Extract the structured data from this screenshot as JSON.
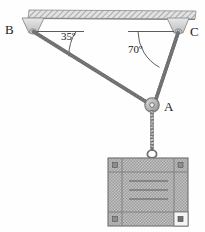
{
  "figure": {
    "type": "physics-free-body-diagram",
    "title": ""
  },
  "labels": {
    "point_b": "B",
    "point_c": "C",
    "point_a": "A",
    "angle_left": "35º",
    "angle_right": "70º"
  },
  "geometry": {
    "ceiling": {
      "x": 28,
      "y": 10,
      "width": 168,
      "height": 9
    },
    "anchor_b": {
      "x": 31,
      "y": 29
    },
    "anchor_c": {
      "x": 178,
      "y": 29
    },
    "ring_a": {
      "x": 152,
      "y": 105,
      "radius": 7
    },
    "block": {
      "x": 108,
      "y": 158,
      "width": 80,
      "height": 68
    },
    "hook": {
      "x": 152,
      "y": 152
    }
  },
  "angles": {
    "left_value": 35,
    "right_value": 70,
    "left_reference": "horizontal at B",
    "right_reference": "horizontal at C"
  },
  "colors": {
    "line": "#6b6b6b",
    "text": "#1a1a1a",
    "hatch": "#9a9a9a",
    "block_fill": "#b9b9b9",
    "ceiling_fill": "#c9c9c9",
    "mount_fill": "#d3d3d3"
  },
  "elements": {
    "ceiling_name": "ceiling-support-bar",
    "cable_ba_name": "cable-b-to-a",
    "cable_ca_name": "cable-c-to-a",
    "cable_vertical_name": "cable-a-to-block",
    "block_name": "hanging-block"
  }
}
